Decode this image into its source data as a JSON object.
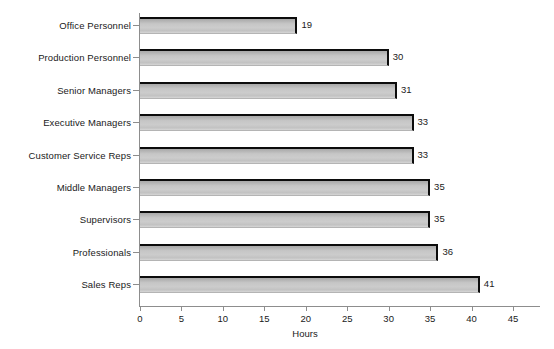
{
  "chart_data": {
    "type": "bar",
    "orientation": "horizontal",
    "title": "",
    "xlabel": "Hours",
    "ylabel": "",
    "xlim": [
      0,
      45
    ],
    "xticks": [
      0,
      5,
      10,
      15,
      20,
      25,
      30,
      35,
      40,
      45
    ],
    "grid": false,
    "legend": null,
    "categories": [
      "Office Personnel",
      "Production Personnel",
      "Senior Managers",
      "Executive Managers",
      "Customer Service Reps",
      "Middle Managers",
      "Supervisors",
      "Professionals",
      "Sales Reps"
    ],
    "values": [
      19,
      30,
      31,
      33,
      33,
      35,
      35,
      36,
      41
    ],
    "data_labels": [
      "19",
      "30",
      "31",
      "33",
      "33",
      "35",
      "35",
      "36",
      "41"
    ],
    "colors": {
      "bar_fill": "#c8c8c8",
      "bar_edge": "#0c0c0c",
      "axis": "#8d8d8d",
      "text": "#1a1a1a",
      "background": "#ffffff"
    }
  }
}
